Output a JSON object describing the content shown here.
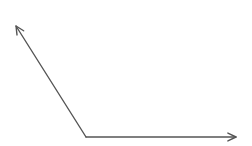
{
  "diagram": {
    "type": "angle",
    "background": "#ffffff",
    "stroke_color": "#555555",
    "stroke_width": 1.4,
    "vertex": {
      "x": 86,
      "y": 137
    },
    "rays": [
      {
        "name": "ray-up-left",
        "end": {
          "x": 16,
          "y": 26
        },
        "arrowhead": true
      },
      {
        "name": "ray-right",
        "end": {
          "x": 236,
          "y": 137
        },
        "arrowhead": true
      }
    ]
  }
}
